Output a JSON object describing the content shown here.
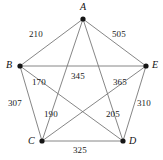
{
  "figure": {
    "title": "",
    "background_color": "#ffffff",
    "edge_color": "#787878",
    "vertex_color": "#151515",
    "label_color": "#1a1a1a"
  },
  "chart_data": {
    "type": "diagram",
    "graph_type": "complete-graph-k5",
    "title": "",
    "xlabel": "",
    "ylabel": "",
    "nodes": [
      {
        "id": "A",
        "label": "A",
        "x": 83,
        "y": 19,
        "label_x": 80,
        "label_y": 2
      },
      {
        "id": "B",
        "label": "B",
        "x": 20,
        "y": 66,
        "label_x": 6,
        "label_y": 60
      },
      {
        "id": "C",
        "label": "C",
        "x": 42,
        "y": 141,
        "label_x": 28,
        "label_y": 136
      },
      {
        "id": "D",
        "label": "D",
        "x": 123,
        "y": 141,
        "label_x": 129,
        "label_y": 136
      },
      {
        "id": "E",
        "label": "E",
        "x": 146,
        "y": 66,
        "label_x": 152,
        "label_y": 60
      }
    ],
    "edges": [
      {
        "from": "A",
        "to": "B",
        "weight": "210",
        "label_x": 29,
        "label_y": 30
      },
      {
        "from": "A",
        "to": "E",
        "weight": "505",
        "label_x": 112,
        "label_y": 30
      },
      {
        "from": "B",
        "to": "E",
        "weight": "345",
        "label_x": 71,
        "label_y": 72
      },
      {
        "from": "B",
        "to": "C",
        "weight": "307",
        "label_x": 8,
        "label_y": 99
      },
      {
        "from": "C",
        "to": "D",
        "weight": "325",
        "label_x": 73,
        "label_y": 146
      },
      {
        "from": "D",
        "to": "E",
        "weight": "310",
        "label_x": 137,
        "label_y": 99
      },
      {
        "from": "B",
        "to": "D",
        "weight": "170",
        "label_x": 32,
        "label_y": 78
      },
      {
        "from": "A",
        "to": "C",
        "weight": "190",
        "label_x": 44,
        "label_y": 110
      },
      {
        "from": "A",
        "to": "D",
        "weight": "205",
        "label_x": 106,
        "label_y": 110
      },
      {
        "from": "C",
        "to": "E",
        "weight": "365",
        "label_x": 113,
        "label_y": 78
      }
    ]
  }
}
